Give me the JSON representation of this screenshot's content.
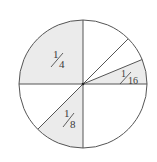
{
  "diagram": {
    "title": "",
    "type": "fraction circle",
    "center": [
      83,
      84
    ],
    "radius": 64,
    "colors": {
      "stroke": "#555555",
      "shade": "#ebebeb",
      "background": "#ffffff",
      "text": "#3a3a3a"
    },
    "dividers_degrees": [
      0,
      22.5,
      45,
      90,
      180,
      225,
      270
    ],
    "regions": [
      {
        "label": "1/4",
        "numerator": "1",
        "denominator": "4",
        "start_deg": 90,
        "end_deg": 180,
        "shaded": true
      },
      {
        "label": "1/16",
        "numerator": "1",
        "denominator": "16",
        "start_deg": 0,
        "end_deg": 22.5,
        "shaded": true
      },
      {
        "label": "1/8",
        "numerator": "1",
        "denominator": "8",
        "start_deg": 225,
        "end_deg": 270,
        "shaded": true
      }
    ]
  }
}
